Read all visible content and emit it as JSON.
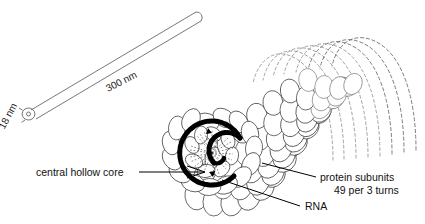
{
  "figure": {
    "kind": "virus-structure-diagram",
    "background_color": "#ffffff",
    "ink_color": "#000000"
  },
  "scale_rod": {
    "length_label": "300 nm",
    "diameter_label": "18 nm",
    "length_label_rotation_deg": -27,
    "diameter_label_rotation_deg": -62
  },
  "labels": {
    "central_hollow_core": "central hollow core",
    "rna": "RNA",
    "protein_subunits_line1": "protein subunits",
    "protein_subunits_line2": "49 per 3 turns"
  },
  "structure": {
    "subunit_rows": 9,
    "subunits_per_row": 13,
    "dashed_arc_count": 8,
    "rna_ring_stroke_width": 5,
    "radial_dash_count": 22
  }
}
